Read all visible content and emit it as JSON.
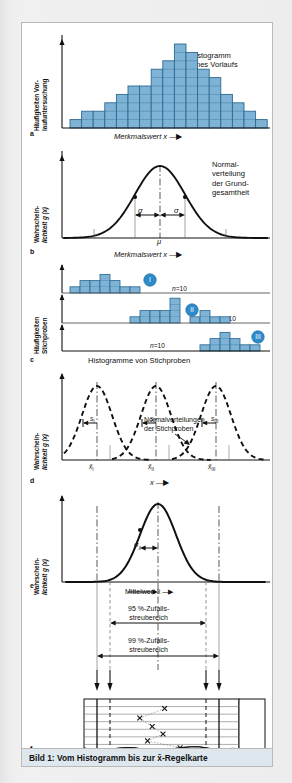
{
  "caption": "Bild 1: Vom Histogramm bis zur x̄-Regelkarte",
  "colors": {
    "bar_fill": "#7fb3d5",
    "bar_stroke": "#2c6a93",
    "badge_fill": "#2e8bc9",
    "axis": "#111111",
    "page_bg": "#ececec",
    "figure_bg": "#ffffff",
    "caption_bg": "#dfe7ee"
  },
  "panels": [
    {
      "id": "a",
      "letter": "a",
      "ylabel_line1": "Häufigkeiten Vor-",
      "ylabel_line2": "laufuntersuchung",
      "xlabel": "Merkmalswert x",
      "annotation_line1": "Histogramm",
      "annotation_line2": "eines Vorlaufs",
      "chart_data": {
        "type": "bar",
        "title": "Histogramm eines Vorlaufs",
        "xlabel": "Merkmalswert x",
        "ylabel": "Häufigkeiten Vorlaufuntersuchung",
        "categories": [
          "1",
          "2",
          "3",
          "4",
          "5",
          "6",
          "7",
          "8",
          "9",
          "10",
          "11",
          "12",
          "13",
          "14",
          "15",
          "16",
          "17"
        ],
        "values": [
          1,
          2,
          2,
          3,
          4,
          5,
          5,
          7,
          8,
          10,
          9,
          7,
          6,
          4,
          3,
          2,
          1
        ],
        "ylim": [
          0,
          10
        ],
        "grid": true
      }
    },
    {
      "id": "b",
      "letter": "b",
      "ylabel_line1": "Wahrschein-",
      "ylabel_line2": "lichkeit g (x)",
      "xlabel": "Merkmalswert x",
      "annotation_line1": "Normal-",
      "annotation_line2": "verteilung",
      "annotation_line3": "der Grund-",
      "annotation_line4": "gesamtheit",
      "sigma_left": "σ",
      "sigma_right": "σ",
      "mu": "μ",
      "chart_data": {
        "type": "line",
        "title": "Normalverteilung der Grundgesamtheit",
        "xlabel": "Merkmalswert x",
        "ylabel": "Wahrscheinlichkeit g (x)",
        "curve": "gaussian",
        "mean_label": "μ",
        "sigma_label": "σ",
        "inflection_markers": 2
      }
    },
    {
      "id": "c",
      "letter": "c",
      "ylabel_line1": "Häufigkeiten",
      "ylabel_line2": "Stichproben",
      "xlabel": "Histogramme von Stichproben",
      "samples": [
        {
          "badge": "I",
          "n_label": "n=10",
          "values": [
            1,
            2,
            2,
            3,
            2,
            1,
            1
          ]
        },
        {
          "badge": "II",
          "n_label": "n=10",
          "values": [
            1,
            2,
            2,
            2,
            4
          ],
          "values2": [
            1,
            2,
            1,
            1
          ]
        },
        {
          "badge": "III",
          "n_label": "n=10",
          "values": [
            1,
            2,
            3,
            2,
            1,
            1
          ]
        }
      ],
      "chart_data": {
        "type": "bar",
        "title": "Histogramme von Stichproben",
        "ylabel": "Häufigkeiten Stichproben",
        "series": [
          {
            "name": "I",
            "values": [
              1,
              2,
              2,
              3,
              2,
              1,
              1
            ]
          },
          {
            "name": "II",
            "values": [
              1,
              2,
              2,
              2,
              4,
              0,
              1,
              2,
              1,
              1
            ]
          },
          {
            "name": "III",
            "values": [
              1,
              2,
              3,
              2,
              1,
              1
            ]
          }
        ],
        "sample_size": 10
      }
    },
    {
      "id": "d",
      "letter": "d",
      "ylabel_line1": "Wahrschein-",
      "ylabel_line2": "lichkeit g (x)",
      "xlabel": "x",
      "annotation_line1": "Normalverteilungen",
      "annotation_line2": "der Stichproben",
      "s_labels": [
        "s₁",
        "s₂",
        "s₃"
      ],
      "s_labels_roman": [
        "I",
        "II",
        "III"
      ],
      "mean_labels_roman": [
        "I",
        "II",
        "III"
      ],
      "chart_data": {
        "type": "line",
        "title": "Normalverteilungen der Stichproben",
        "xlabel": "x",
        "ylabel": "Wahrscheinlichkeit g (x)",
        "curves": 3,
        "style": "dashed",
        "mean_labels": [
          "x̄_I",
          "x̄_II",
          "x̄_III"
        ],
        "spread_labels": [
          "s_I",
          "s_II",
          "s_III"
        ]
      }
    },
    {
      "id": "e",
      "letter": "e",
      "ylabel_line1": "Wahrschein-",
      "ylabel_line2": "lichkeit g (x)",
      "sigma_x": "σ",
      "sigma_x_sub": "x",
      "mean_label": "Mittelwert x̄",
      "band95_line1": "95 %-Zufalls-",
      "band95_line2": "streubereich",
      "band99_line1": "99 %-Zufalls-",
      "band99_line2": "streubereich",
      "chart_data": {
        "type": "line",
        "title": "Verteilung der Mittelwerte",
        "ylabel": "Wahrscheinlichkeit g (x)",
        "curve": "gaussian",
        "mean_label": "Mittelwert x̄",
        "sigma_label": "σx̄",
        "bands": [
          {
            "label": "95 %-Zufallsstreubereich",
            "level": 95
          },
          {
            "label": "99 %-Zufallsstreubereich",
            "level": 99
          }
        ]
      }
    },
    {
      "id": "f",
      "letter": "f",
      "rot_line1": "Prozess-",
      "rot_line2": "x̄ -",
      "rot_line3": "regelkarte",
      "chart_data": {
        "type": "scatter",
        "title": "Prozess-x̄-Regelkarte",
        "marker": "x",
        "points": [
          {
            "x": 0.52,
            "y": 0.18
          },
          {
            "x": 0.36,
            "y": 0.36
          },
          {
            "x": 0.44,
            "y": 0.52
          },
          {
            "x": 0.51,
            "y": 0.66
          },
          {
            "x": 0.41,
            "y": 0.79
          },
          {
            "x": 0.62,
            "y": 0.92
          }
        ],
        "control_lines": [
          "UCL",
          "UWL",
          "LWL",
          "LCL"
        ],
        "grid_rows": 7
      }
    }
  ]
}
